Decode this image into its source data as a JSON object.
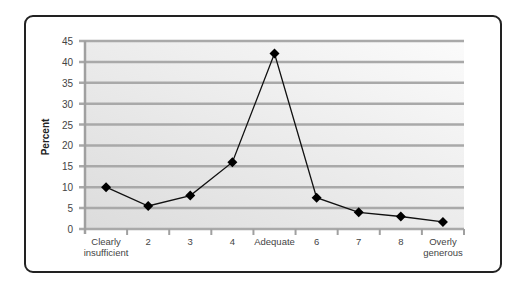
{
  "chart_data": {
    "type": "line",
    "title": "",
    "xlabel": "",
    "ylabel": "Percent",
    "ylim": [
      0,
      45
    ],
    "yticks": [
      0,
      5,
      10,
      15,
      20,
      25,
      30,
      35,
      40,
      45
    ],
    "grid": true,
    "legend": null,
    "categories": [
      "Clearly insufficient",
      "2",
      "3",
      "4",
      "Adequate",
      "6",
      "7",
      "8",
      "Overly generous"
    ],
    "series": [
      {
        "name": "Percent",
        "values": [
          10,
          5.5,
          8,
          16,
          42,
          7.5,
          4,
          3,
          1.7
        ],
        "marker": "diamond",
        "color": "#000000"
      }
    ]
  },
  "labels": {
    "ylabel": "Percent",
    "yticks": [
      "0",
      "5",
      "10",
      "15",
      "20",
      "25",
      "30",
      "35",
      "40",
      "45"
    ],
    "xticks_line1": [
      "Clearly",
      "2",
      "3",
      "4",
      "Adequate",
      "6",
      "7",
      "8",
      "Overly"
    ],
    "xticks_line2": [
      "insufficient",
      "",
      "",
      "",
      "",
      "",
      "",
      "",
      "generous"
    ]
  },
  "colors": {
    "grid": "#a9a9a9",
    "plot_bg_from": "#dcdcdc",
    "plot_bg_to": "#fbfbfb",
    "line": "#111111",
    "border": "#222222"
  }
}
